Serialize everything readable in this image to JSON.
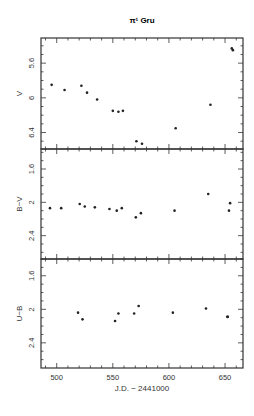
{
  "chart_data": [
    {
      "type": "scatter",
      "title": "π¹ Gru",
      "panel": "V",
      "xlabel": "J.D. − 2441000",
      "ylabel": "V",
      "xlim": [
        486,
        666
      ],
      "ylim": [
        6.59,
        5.31
      ],
      "y_inverted": true,
      "xticks": [
        500,
        550,
        600,
        650
      ],
      "yticks": [
        5.6,
        6,
        6.4
      ],
      "ytick_labels": [
        "5.6",
        "6",
        "6.4"
      ],
      "grid": false,
      "x": [
        495.5,
        507,
        522,
        527,
        536,
        550,
        555,
        559,
        571,
        576,
        606,
        637,
        656,
        657
      ],
      "y": [
        5.85,
        5.91,
        5.86,
        5.94,
        6.02,
        6.15,
        6.16,
        6.15,
        6.5,
        6.53,
        6.35,
        6.08,
        5.43,
        5.45
      ]
    },
    {
      "type": "scatter",
      "panel": "B−V",
      "xlabel": "J.D. − 2441000",
      "ylabel": "B−V",
      "xlim": [
        486,
        666
      ],
      "ylim": [
        2.68,
        1.36
      ],
      "y_inverted": true,
      "yticks": [
        1.6,
        2,
        2.4
      ],
      "ytick_labels": [
        "1.6",
        "2",
        "2.4"
      ],
      "grid": false,
      "x": [
        494,
        504,
        520.5,
        525,
        534,
        547,
        553.5,
        558,
        570.5,
        575,
        605,
        635,
        653.5,
        654.5
      ],
      "y": [
        2.07,
        2.07,
        2.02,
        2.05,
        2.06,
        2.08,
        2.1,
        2.07,
        2.18,
        2.13,
        2.1,
        1.9,
        2.1,
        2.01
      ]
    },
    {
      "type": "scatter",
      "panel": "U−B",
      "xlabel": "J.D. − 2441000",
      "ylabel": "U−B",
      "xlim": [
        486,
        666
      ],
      "ylim": [
        2.7,
        1.4
      ],
      "y_inverted": true,
      "xticks": [
        500,
        550,
        600,
        650
      ],
      "xtick_labels": [
        "500",
        "550",
        "600",
        "650"
      ],
      "yticks": [
        1.6,
        2,
        2.4
      ],
      "ytick_labels": [
        "1.6",
        "2",
        "2.4"
      ],
      "grid": false,
      "x": [
        519,
        523,
        552,
        555,
        569,
        573,
        603.5,
        633,
        652,
        652.5
      ],
      "y": [
        2.04,
        2.12,
        2.14,
        2.05,
        2.05,
        1.96,
        2.04,
        1.99,
        2.09,
        2.09
      ]
    }
  ],
  "figure": {
    "title": "π¹ Gru",
    "xlabel": "J.D. − 2441000",
    "panels": [
      {
        "ylabel": "V",
        "yticks": [
          "5.6",
          "6",
          "6.4"
        ]
      },
      {
        "ylabel": "B−V",
        "yticks": [
          "1.6",
          "2",
          "2.4"
        ]
      },
      {
        "ylabel": "U−B",
        "yticks": [
          "1.6",
          "2",
          "2.4"
        ]
      }
    ],
    "xticks": [
      "500",
      "550",
      "600",
      "650"
    ]
  }
}
